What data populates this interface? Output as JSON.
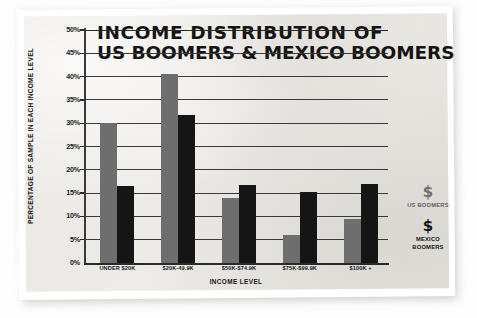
{
  "chart_data": {
    "type": "bar",
    "title": "INCOME DISTRIBUTION OF US BOOMERS & MEXICO BOOMERS",
    "title_line_1": "INCOME DISTRIBUTION OF",
    "title_line_2": "US BOOMERS & MEXICO BOOMERS",
    "xlabel": "INCOME LEVEL",
    "ylabel": "PERCENTAGE OF SAMPLE IN EACH INCOME LEVEL",
    "categories": [
      "UNDER $20K",
      "$20K-49.9K",
      "$50K-$74.9K",
      "$75K-$99.9K",
      "$100K +"
    ],
    "series": [
      {
        "name": "US BOOMERS",
        "color": "#6e6e6e",
        "values": [
          30,
          40.5,
          14,
          6,
          9.5
        ]
      },
      {
        "name": "MEXICO BOOMERS",
        "color": "#151515",
        "values": [
          16.5,
          31.7,
          16.7,
          15.2,
          17
        ]
      }
    ],
    "ylim": [
      0,
      50
    ],
    "yticks": [
      "50%",
      "45%",
      "40%",
      "35%",
      "30%",
      "25%",
      "20%",
      "15%",
      "10%",
      "5%",
      "0%"
    ],
    "ytick_values": [
      50,
      45,
      40,
      35,
      30,
      25,
      20,
      15,
      10,
      5,
      0
    ],
    "grid": true,
    "legend_position": "right"
  },
  "legend": {
    "entries": [
      {
        "symbol": "$",
        "label_line_1": "US BOOMERS",
        "label_line_2": "",
        "color": "#6e6e6e"
      },
      {
        "symbol": "$",
        "label_line_1": "MEXICO",
        "label_line_2": "BOOMERS",
        "color": "#151515"
      }
    ]
  },
  "colors": {
    "us_boomers": "#6e6e6e",
    "mexico_boomers": "#151515",
    "paper": "#eceae6",
    "ink": "#141414"
  }
}
